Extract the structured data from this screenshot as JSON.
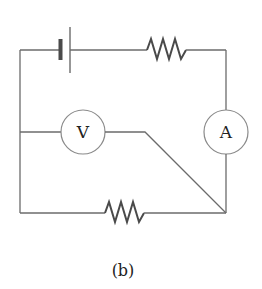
{
  "diagram": {
    "type": "circuit",
    "caption": "(b)",
    "components": {
      "battery": {
        "label": ""
      },
      "top_resistor": {
        "label": ""
      },
      "bottom_resistor": {
        "label": ""
      },
      "voltmeter": {
        "label": "V"
      },
      "ammeter": {
        "label": "A"
      }
    },
    "colors": {
      "wire": "#6b6b6b",
      "resistor": "#4a4a4a",
      "meter_outline": "#8a8a8a",
      "text": "#222222"
    }
  }
}
